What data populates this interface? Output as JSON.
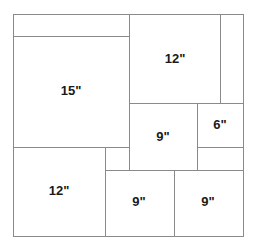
{
  "diagram": {
    "line_color": "#8a8a8a",
    "labels": {
      "block_15": "15\"",
      "block_12_top": "12\"",
      "block_12_bottom": "12\"",
      "block_9_middle": "9\"",
      "block_6": "6\"",
      "block_9_bottom_left": "9\"",
      "block_9_bottom_right": "9\""
    }
  }
}
